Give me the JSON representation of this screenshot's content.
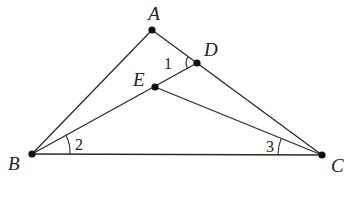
{
  "figure": {
    "type": "geometry",
    "width": 355,
    "height": 215,
    "points": {
      "A": {
        "label": "A",
        "x": 152,
        "y": 30,
        "label_x": 154,
        "label_y": 20
      },
      "D": {
        "label": "D",
        "x": 197,
        "y": 63,
        "label_x": 204,
        "label_y": 56
      },
      "E": {
        "label": "E",
        "x": 155,
        "y": 87,
        "label_x": 133,
        "label_y": 86
      },
      "B": {
        "label": "B",
        "x": 32,
        "y": 154,
        "label_x": 8,
        "label_y": 170
      },
      "C": {
        "label": "C",
        "x": 322,
        "y": 155,
        "label_x": 331,
        "label_y": 172
      }
    },
    "segments": [
      [
        "A",
        "B"
      ],
      [
        "A",
        "C"
      ],
      [
        "B",
        "D"
      ],
      [
        "E",
        "C"
      ],
      [
        "B",
        "C"
      ]
    ],
    "angles": [
      {
        "label": "1",
        "vertex": "D",
        "between": [
          "A",
          "E"
        ],
        "label_x": 164,
        "label_y": 69
      },
      {
        "label": "2",
        "vertex": "B",
        "between": [
          "D",
          "C"
        ],
        "label_x": 75,
        "label_y": 150
      },
      {
        "label": "3",
        "vertex": "C",
        "between": [
          "B",
          "E"
        ],
        "label_x": 266,
        "label_y": 152
      }
    ]
  }
}
